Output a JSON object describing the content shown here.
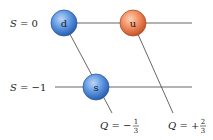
{
  "diagram": {
    "type": "quark weight diagram",
    "strangeness_levels": [
      {
        "label_var": "S",
        "label_eq": "= 0",
        "value": 0
      },
      {
        "label_var": "S",
        "label_eq": "= −1",
        "value": -1
      }
    ],
    "charge_lines": [
      {
        "label_var": "Q",
        "label_eq": "= −",
        "num": "1",
        "den": "3",
        "value": "-1/3"
      },
      {
        "label_var": "Q",
        "label_eq": "= +",
        "num": "2",
        "den": "3",
        "value": "+2/3"
      }
    ],
    "nodes": [
      {
        "id": "d",
        "label": "d",
        "strangeness": 0,
        "charge": "-1/3",
        "color": "#4a86d8"
      },
      {
        "id": "u",
        "label": "u",
        "strangeness": 0,
        "charge": "+2/3",
        "color": "#ee7f50"
      },
      {
        "id": "s",
        "label": "s",
        "strangeness": -1,
        "charge": "-1/3",
        "color": "#4a86d8"
      }
    ],
    "colors": {
      "blue_node": "#4a86d8",
      "orange_node": "#ee7f50",
      "line": "#555555"
    }
  }
}
